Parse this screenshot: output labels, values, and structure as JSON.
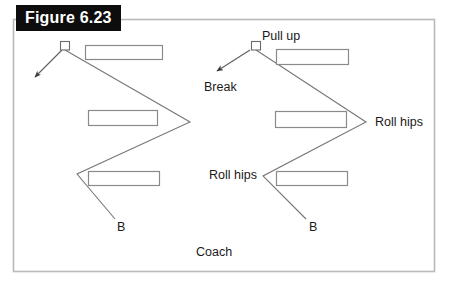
{
  "figure": {
    "label": "Figure 6.23",
    "width": 449,
    "height": 283,
    "background_color": "#ffffff",
    "label_background_color": "#0d0d0d",
    "label_text_color": "#ffffff",
    "border_color": "#b8b8b8",
    "line_color": "#6e6e6e",
    "shape_stroke_color": "#7a7a7a",
    "text_color": "#1a1a1a"
  },
  "frame": {
    "left": 13,
    "top": 19,
    "right": 435,
    "bottom": 272
  },
  "annotations": {
    "pull_up": "Pull up",
    "break": "Break",
    "roll_hips_right": "Roll hips",
    "roll_hips_left": "Roll hips",
    "player_b_left": "B",
    "player_b_right": "B",
    "coach": "Coach"
  },
  "shapes": {
    "squares": [
      {
        "name": "start-square-left",
        "x": 60,
        "y": 41,
        "w": 10,
        "h": 9
      },
      {
        "name": "start-square-right",
        "x": 251,
        "y": 41,
        "w": 10,
        "h": 9
      }
    ],
    "rectangles": [
      {
        "name": "cone-rect-left-top",
        "x": 85,
        "y": 45,
        "w": 78,
        "h": 15
      },
      {
        "name": "cone-rect-left-middle",
        "x": 88,
        "y": 110,
        "w": 70,
        "h": 16
      },
      {
        "name": "cone-rect-left-bottom",
        "x": 88,
        "y": 171,
        "w": 72,
        "h": 15
      },
      {
        "name": "cone-rect-right-top",
        "x": 276,
        "y": 49,
        "w": 73,
        "h": 16
      },
      {
        "name": "cone-rect-right-middle",
        "x": 275,
        "y": 111,
        "w": 72,
        "h": 17
      },
      {
        "name": "cone-rect-right-bottom",
        "x": 276,
        "y": 171,
        "w": 72,
        "h": 15
      }
    ],
    "zigzag_paths": [
      {
        "name": "zigzag-path-left",
        "points": "65,50 190,122 77,174 115,219"
      },
      {
        "name": "zigzag-path-right",
        "points": "256,50 366,122 263,176 306,219"
      }
    ],
    "arrows": [
      {
        "name": "break-arrow-left",
        "x1": 62,
        "y1": 50,
        "x2": 34,
        "y2": 78
      },
      {
        "name": "break-arrow-right",
        "x1": 250,
        "y1": 50,
        "x2": 216,
        "y2": 72
      }
    ]
  }
}
